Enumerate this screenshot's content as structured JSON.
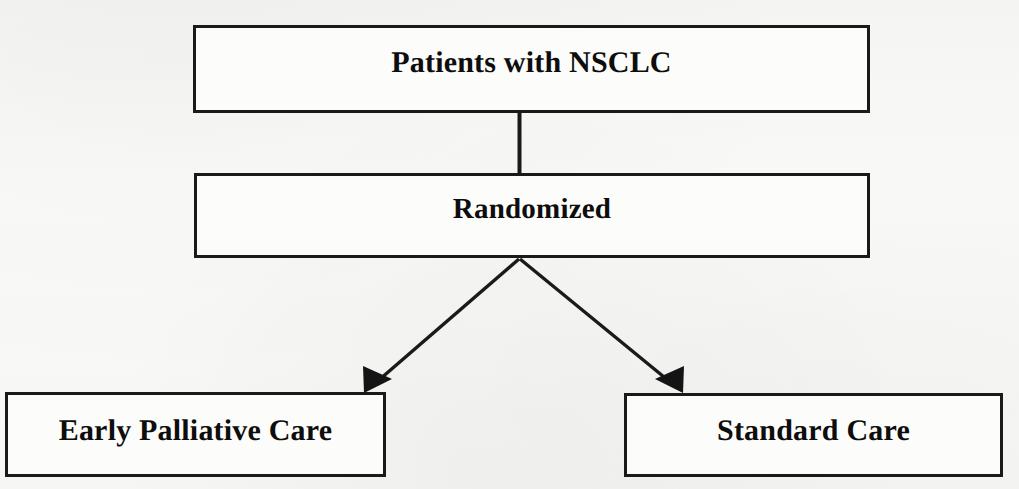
{
  "figure": {
    "type": "flowchart",
    "caption_partial_cut_off": "",
    "background_color": "#f7f7f5",
    "line_color": "#1a1a1a",
    "text_color": "#0d0d0d"
  },
  "nodes": [
    {
      "id": "patients",
      "label": "Patients with NSCLC",
      "level": 1,
      "x": 193,
      "y": 25,
      "width": 677,
      "height": 88
    },
    {
      "id": "randomized",
      "label": "Randomized",
      "level": 2,
      "x": 194,
      "y": 173,
      "width": 676,
      "height": 85
    },
    {
      "id": "early_palliative_care",
      "label": "Early Palliative Care",
      "level": 3,
      "x": 5,
      "y": 392,
      "width": 381,
      "height": 85
    },
    {
      "id": "standard_care",
      "label": "Standard Care",
      "level": 3,
      "x": 624,
      "y": 393,
      "width": 379,
      "height": 84
    }
  ],
  "connectors": [
    {
      "id": "patients-to-randomized",
      "from": "patients",
      "to": "randomized",
      "style": "plain-line",
      "arrowhead": false
    },
    {
      "id": "randomized-to-early-palliative-care",
      "from": "randomized",
      "to": "early_palliative_care",
      "style": "diagonal-arrow",
      "arrowhead": true,
      "direction": "down-left"
    },
    {
      "id": "randomized-to-standard-care",
      "from": "randomized",
      "to": "standard_care",
      "style": "diagonal-arrow",
      "arrowhead": true,
      "direction": "down-right"
    }
  ]
}
